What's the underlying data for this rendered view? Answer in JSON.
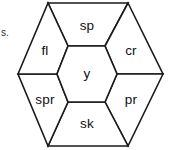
{
  "figure": {
    "type": "hexagon-partition-diagram",
    "stroke_color": "#1a1a1a",
    "fill_color": "#ffffff",
    "label_color": "#101010",
    "outer_hexagon": {
      "name": "outer-hexagon",
      "vertices": [
        [
          48,
          3
        ],
        [
          128,
          3
        ],
        [
          163,
          74
        ],
        [
          128,
          146
        ],
        [
          48,
          146
        ],
        [
          18,
          74
        ]
      ]
    },
    "center_cell": {
      "name": "center-hexagon",
      "label": "y",
      "vertices": [
        [
          68,
          46
        ],
        [
          105,
          46
        ],
        [
          117,
          74
        ],
        [
          105,
          102
        ],
        [
          68,
          102
        ],
        [
          57,
          74
        ]
      ],
      "label_pos": [
        87,
        74
      ]
    },
    "cells": [
      {
        "name": "cell-sp",
        "label": "sp",
        "position": "top",
        "vertices": [
          [
            48,
            3
          ],
          [
            128,
            3
          ],
          [
            105,
            46
          ],
          [
            68,
            46
          ]
        ],
        "label_pos": [
          87,
          26
        ]
      },
      {
        "name": "cell-cr",
        "label": "cr",
        "position": "top-right",
        "vertices": [
          [
            128,
            3
          ],
          [
            163,
            74
          ],
          [
            117,
            74
          ],
          [
            105,
            46
          ]
        ],
        "label_pos": [
          131,
          51
        ]
      },
      {
        "name": "cell-pr",
        "label": "pr",
        "position": "bottom-right",
        "vertices": [
          [
            163,
            74
          ],
          [
            128,
            146
          ],
          [
            105,
            102
          ],
          [
            117,
            74
          ]
        ],
        "label_pos": [
          131,
          100
        ]
      },
      {
        "name": "cell-sk",
        "label": "sk",
        "position": "bottom",
        "vertices": [
          [
            128,
            146
          ],
          [
            48,
            146
          ],
          [
            68,
            102
          ],
          [
            105,
            102
          ]
        ],
        "label_pos": [
          87,
          124
        ]
      },
      {
        "name": "cell-spr",
        "label": "spr",
        "position": "bottom-left",
        "vertices": [
          [
            48,
            146
          ],
          [
            18,
            74
          ],
          [
            57,
            74
          ],
          [
            68,
            102
          ]
        ],
        "label_pos": [
          45,
          100
        ]
      },
      {
        "name": "cell-fl",
        "label": "fl",
        "position": "top-left",
        "vertices": [
          [
            18,
            74
          ],
          [
            48,
            3
          ],
          [
            68,
            46
          ],
          [
            57,
            74
          ]
        ],
        "label_pos": [
          45,
          51
        ]
      }
    ]
  },
  "margin_note": {
    "name": "cropped-margin-text",
    "text": "s.",
    "pos": [
      1,
      28
    ]
  }
}
